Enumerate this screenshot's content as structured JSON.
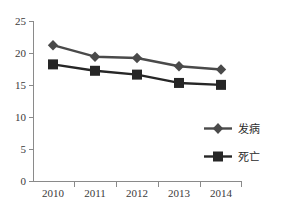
{
  "chart_data": {
    "type": "line",
    "title": "",
    "subtitle": "",
    "xlabel": "",
    "ylabel": "",
    "categories": [
      "2010",
      "2011",
      "2012",
      "2013",
      "2014"
    ],
    "series": [
      {
        "name": "发病",
        "marker": "diamond",
        "color": "#4a4a4a",
        "values": [
          21.3,
          19.5,
          19.3,
          18.0,
          17.5
        ]
      },
      {
        "name": "死亡",
        "marker": "square",
        "color": "#262626",
        "values": [
          18.3,
          17.3,
          16.7,
          15.4,
          15.1
        ]
      }
    ],
    "ylim": [
      0,
      25
    ],
    "yticks": [
      0,
      5,
      10,
      15,
      20,
      25
    ],
    "ytick_labels": [
      "0",
      "5",
      "10",
      "15",
      "20",
      "25"
    ],
    "xtick_labels": [
      "2010",
      "2011",
      "2012",
      "2013",
      "2014"
    ],
    "grid": false,
    "legend_position": "center-right",
    "legend_entries": [
      "发病",
      "死亡"
    ],
    "axis_color": "#8a8a8a",
    "background_color": "#ffffff"
  },
  "axes": {
    "y_tick_0": "0",
    "y_tick_1": "5",
    "y_tick_2": "10",
    "y_tick_3": "15",
    "y_tick_4": "20",
    "y_tick_5": "25",
    "x_tick_0": "2010",
    "x_tick_1": "2011",
    "x_tick_2": "2012",
    "x_tick_3": "2013",
    "x_tick_4": "2014"
  },
  "legend": {
    "item_0": "发病",
    "item_1": "死亡"
  }
}
